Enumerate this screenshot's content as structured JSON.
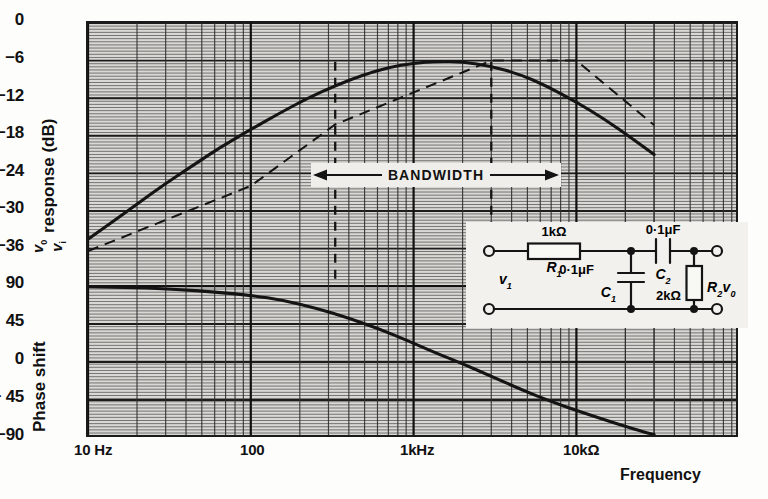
{
  "figure": {
    "kind": "bode-plot",
    "background": "#d9d8d4",
    "ink": "#141414"
  },
  "axes": {
    "gain": {
      "title_prefix": "",
      "title_suffix": " response (dB)",
      "fraction_numerator": "v",
      "fraction_numerator_sub": "0",
      "fraction_denominator": "v",
      "fraction_denominator_sub": "i",
      "ticks": [
        "0",
        "−6",
        "−12",
        "−18",
        "−24",
        "−30",
        "−36"
      ]
    },
    "phase": {
      "title": "Phase shift",
      "ticks": [
        "90",
        "45",
        "0",
        "− 45",
        "−90"
      ]
    },
    "frequency": {
      "title": "Frequency",
      "ticks": [
        "10 Hz",
        "100",
        "1kHz",
        "10kΩ"
      ]
    }
  },
  "annotations": {
    "bandwidth_label": "BANDWIDTH"
  },
  "circuit": {
    "r1_value": "1kΩ",
    "r1_name": "R",
    "r1_sub": "1",
    "c1_value": "0·1μF",
    "c1_name": "C",
    "c1_sub": "1",
    "c2_value": "0·1μF",
    "c2_name": "C",
    "c2_sub": "2",
    "r2_value": "2kΩ",
    "r2_name": "R",
    "r2_sub": "2",
    "vin_name": "v",
    "vin_sub": "1",
    "vout_name": "v",
    "vout_sub": "0"
  },
  "chart_data": {
    "type": "line",
    "title": "",
    "xlabel": "Frequency",
    "ylabel": "v0/vi response (dB)",
    "xscale": "log",
    "xlim": [
      10,
      30000
    ],
    "xticks": [
      10,
      100,
      1000,
      10000
    ],
    "xticklabels": [
      "10 Hz",
      "100",
      "1kHz",
      "10kΩ"
    ],
    "grid": true,
    "legend": "none",
    "panels": [
      {
        "name": "gain",
        "ylabel": "v0/vi response (dB)",
        "ylim": [
          -40.8,
          0
        ],
        "yticks": [
          0,
          -6,
          -12,
          -18,
          -24,
          -30,
          -36
        ],
        "series": [
          {
            "name": "gain response",
            "style": "solid",
            "x": [
              10,
              14,
              20,
              30,
              45,
              65,
              100,
              150,
              220,
              330,
              500,
              700,
              1000,
              1400,
              2000,
              3000,
              4500,
              6500,
              10000,
              15000,
              22000,
              30000
            ],
            "y": [
              -34.5,
              -31.8,
              -28.9,
              -25.6,
              -22.6,
              -19.8,
              -17.0,
              -14.4,
              -12.1,
              -10.0,
              -8.2,
              -7.1,
              -6.4,
              -6.1,
              -6.2,
              -6.9,
              -8.2,
              -10.0,
              -12.6,
              -15.4,
              -18.4,
              -21.0
            ]
          },
          {
            "name": "asymptotic approximation",
            "style": "dashed",
            "x": [
              10,
              100,
              330,
              3000,
              10000,
              30000
            ],
            "y": [
              -36.4,
              -26.0,
              -16.2,
              -6.0,
              -6.0,
              -16.3
            ]
          }
        ]
      },
      {
        "name": "phase",
        "ylabel": "Phase shift",
        "ylim": [
          -90,
          90
        ],
        "yticks": [
          90,
          45,
          0,
          -45,
          -90
        ],
        "series": [
          {
            "name": "phase response",
            "style": "solid",
            "x": [
              10,
              20,
              35,
              60,
              100,
              160,
              250,
              400,
              600,
              900,
              1400,
              2000,
              3000,
              4500,
              7000,
              11000,
              17000,
              25000,
              30000
            ],
            "y": [
              89,
              88,
              86,
              83,
              79,
              73,
              64,
              52,
              40,
              26,
              10,
              -2,
              -17,
              -32,
              -47,
              -60,
              -72,
              -82,
              -86
            ]
          }
        ]
      }
    ],
    "annotations": [
      {
        "type": "span-arrow",
        "label": "BANDWIDTH",
        "x_from": 330,
        "x_to": 3000,
        "y": -17.8
      },
      {
        "type": "vline",
        "style": "dashed",
        "x": 330,
        "from_y": -6.2,
        "to_y": -40.8
      },
      {
        "type": "vline",
        "style": "dashed",
        "x": 3000,
        "from_y": -6.2,
        "to_y": -40.8
      }
    ],
    "inset": {
      "type": "schematic",
      "description": "RC band-pass network",
      "components": [
        "R1 = 1kΩ series",
        "C1 = 0·1μF shunt",
        "C2 = 0·1μF series",
        "R2 = 2kΩ shunt"
      ],
      "ports": [
        "v1 input",
        "v0 output"
      ]
    }
  }
}
